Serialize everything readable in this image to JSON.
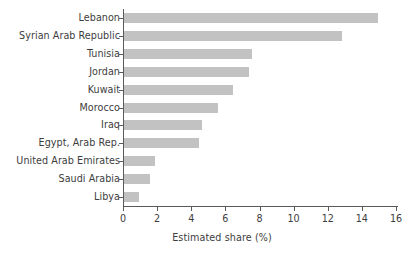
{
  "chart_data": {
    "type": "bar",
    "orientation": "horizontal",
    "title": "",
    "xlabel": "Estimated share (%)",
    "ylabel": "",
    "xlim": [
      0,
      16
    ],
    "xticks": [
      0,
      2,
      4,
      6,
      8,
      10,
      12,
      14,
      16
    ],
    "xticklabels": [
      "0",
      "2",
      "4",
      "6",
      "8",
      "10",
      "12",
      "14",
      "16"
    ],
    "grid": false,
    "legend": false,
    "bar_color": "#c2c2c2",
    "axis_color": "#5a5a5a",
    "text_color": "#3d3d3d",
    "categories": [
      "Lebanon",
      "Syrian Arab Republic",
      "Tunisia",
      "Jordan",
      "Kuwait",
      "Morocco",
      "Iraq",
      "Egypt, Arab Rep.",
      "United Arab Emirates",
      "Saudi Arabia",
      "Libya"
    ],
    "values": [
      14.9,
      12.8,
      7.5,
      7.3,
      6.4,
      5.5,
      4.6,
      4.4,
      1.8,
      1.5,
      0.9
    ]
  }
}
